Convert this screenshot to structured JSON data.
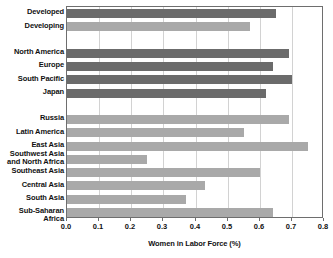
{
  "chart_data": {
    "type": "bar",
    "orientation": "horizontal",
    "title": "",
    "xlabel": "Women in Labor Force (%)",
    "ylabel": "",
    "xlim": [
      0.0,
      0.8
    ],
    "xticks": [
      "0.0",
      "0.1",
      "0.2",
      "0.3",
      "0.4",
      "0.5",
      "0.6",
      "0.7",
      "0.8"
    ],
    "xtick_values": [
      0.0,
      0.1,
      0.2,
      0.3,
      0.4,
      0.5,
      0.6,
      0.7,
      0.8
    ],
    "grid": "vertical",
    "legend": "none",
    "colors": {
      "dark_bar": "#6b6b6b",
      "light_bar": "#a9a9a9",
      "frame": "#6e6e6e",
      "gridline": "#d2d2d2",
      "text": "#111111",
      "background": "#ffffff"
    },
    "categories": [
      "Developed",
      "Developing",
      "",
      "North America",
      "Europe",
      "South Pacific",
      "Japan",
      "",
      "Russia",
      "Latin America",
      "East Asia",
      "Southwest Asia and North Africa",
      "Southeast Asia",
      "Central Asia",
      "South Asia",
      "Sub-Saharan Africa"
    ],
    "values": [
      0.65,
      0.57,
      null,
      0.69,
      0.64,
      0.7,
      0.62,
      null,
      0.69,
      0.55,
      0.75,
      0.25,
      0.6,
      0.43,
      0.37,
      0.64
    ],
    "rows": [
      {
        "label": "Developed",
        "label_line2": "",
        "value": 0.65,
        "shade": "dark",
        "spacer": false
      },
      {
        "label": "Developing",
        "label_line2": "",
        "value": 0.57,
        "shade": "light",
        "spacer": false
      },
      {
        "label": "",
        "label_line2": "",
        "value": null,
        "shade": "light",
        "spacer": true
      },
      {
        "label": "North America",
        "label_line2": "",
        "value": 0.69,
        "shade": "dark",
        "spacer": false
      },
      {
        "label": "Europe",
        "label_line2": "",
        "value": 0.64,
        "shade": "dark",
        "spacer": false
      },
      {
        "label": "South Pacific",
        "label_line2": "",
        "value": 0.7,
        "shade": "dark",
        "spacer": false
      },
      {
        "label": "Japan",
        "label_line2": "",
        "value": 0.62,
        "shade": "dark",
        "spacer": false
      },
      {
        "label": "",
        "label_line2": "",
        "value": null,
        "shade": "light",
        "spacer": true
      },
      {
        "label": "Russia",
        "label_line2": "",
        "value": 0.69,
        "shade": "light",
        "spacer": false
      },
      {
        "label": "Latin America",
        "label_line2": "",
        "value": 0.55,
        "shade": "light",
        "spacer": false
      },
      {
        "label": "East Asia",
        "label_line2": "",
        "value": 0.75,
        "shade": "light",
        "spacer": false
      },
      {
        "label": "Southwest Asia",
        "label_line2": "and North Africa",
        "value": 0.25,
        "shade": "light",
        "spacer": false
      },
      {
        "label": "Southeast Asia",
        "label_line2": "",
        "value": 0.6,
        "shade": "light",
        "spacer": false
      },
      {
        "label": "Central Asia",
        "label_line2": "",
        "value": 0.43,
        "shade": "light",
        "spacer": false
      },
      {
        "label": "South Asia",
        "label_line2": "",
        "value": 0.37,
        "shade": "light",
        "spacer": false
      },
      {
        "label": "Sub-Saharan Africa",
        "label_line2": "",
        "value": 0.64,
        "shade": "light",
        "spacer": false
      }
    ]
  }
}
